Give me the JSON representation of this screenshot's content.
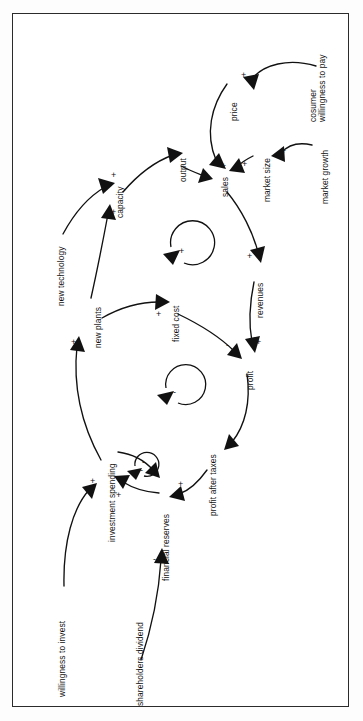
{
  "figure": {
    "type": "causal-loop-diagram",
    "orientation": "rotated-90-ccw",
    "border_color": "#2b2b2b",
    "ink_color": "#111111",
    "background": "#ffffff"
  },
  "nodes": [
    {
      "id": "consumer_willingness",
      "label_line1": "cosumer",
      "label_line2": "willingness to pay"
    },
    {
      "id": "price",
      "label": "price"
    },
    {
      "id": "market_growth",
      "label": "market growth"
    },
    {
      "id": "market_size",
      "label": "market size"
    },
    {
      "id": "sales",
      "label": "sales"
    },
    {
      "id": "output",
      "label": "output"
    },
    {
      "id": "capacity",
      "label": "capacity"
    },
    {
      "id": "new_technology",
      "label": "new technology"
    },
    {
      "id": "new_plants",
      "label": "new plants"
    },
    {
      "id": "fixed_cost",
      "label": "fixed cost"
    },
    {
      "id": "revenues",
      "label": "revenues"
    },
    {
      "id": "profit",
      "label": "profit"
    },
    {
      "id": "profit_after_taxes",
      "label": "profit after taxes"
    },
    {
      "id": "investment_spending",
      "label": "investment spending"
    },
    {
      "id": "financial_reserves",
      "label": "financial reserves"
    },
    {
      "id": "willingness_to_invest",
      "label": "willingness to invest"
    },
    {
      "id": "shareholders_dividend",
      "label": "shareholders dividend"
    }
  ],
  "links": [
    {
      "from": "consumer_willingness",
      "to": "price",
      "sign": "+"
    },
    {
      "from": "price",
      "to": "sales",
      "sign": "+"
    },
    {
      "from": "market_growth",
      "to": "market_size",
      "sign": "+"
    },
    {
      "from": "market_size",
      "to": "sales",
      "sign": "+"
    },
    {
      "from": "output",
      "to": "sales",
      "sign": "+"
    },
    {
      "from": "capacity",
      "to": "output",
      "sign": "+"
    },
    {
      "from": "new_technology",
      "to": "capacity",
      "sign": "+"
    },
    {
      "from": "new_plants",
      "to": "capacity",
      "sign": "+"
    },
    {
      "from": "new_plants",
      "to": "fixed_cost",
      "sign": "+"
    },
    {
      "from": "sales",
      "to": "revenues",
      "sign": "+"
    },
    {
      "from": "revenues",
      "to": "profit",
      "sign": "+"
    },
    {
      "from": "fixed_cost",
      "to": "profit",
      "sign": "-"
    },
    {
      "from": "profit",
      "to": "profit_after_taxes",
      "sign": "+"
    },
    {
      "from": "profit_after_taxes",
      "to": "financial_reserves",
      "sign": "+"
    },
    {
      "from": "financial_reserves",
      "to": "investment_spending",
      "sign": "+"
    },
    {
      "from": "investment_spending",
      "to": "financial_reserves",
      "sign": "-"
    },
    {
      "from": "investment_spending",
      "to": "new_plants",
      "sign": "+"
    },
    {
      "from": "willingness_to_invest",
      "to": "investment_spending",
      "sign": "+"
    },
    {
      "from": "shareholders_dividend",
      "to": "financial_reserves",
      "sign": "-"
    }
  ],
  "loops": [
    {
      "id": "growth-loop",
      "polarity": "+",
      "note": "reinforcing loop, counter-clockwise"
    },
    {
      "id": "cost-loop",
      "polarity": "-",
      "note": "balancing loop, counter-clockwise"
    },
    {
      "id": "reserves-loop",
      "polarity": "-",
      "note": "balancing loop, counter-clockwise"
    }
  ],
  "signs": {
    "plus": "+",
    "minus": "-"
  }
}
